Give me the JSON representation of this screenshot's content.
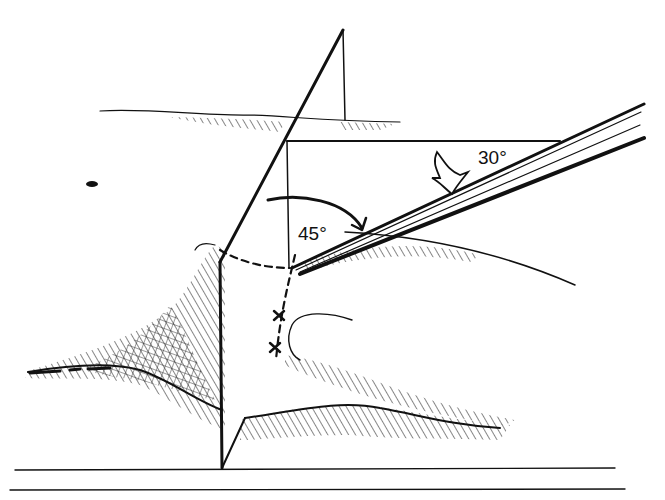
{
  "diagram": {
    "type": "medical-illustration",
    "labels": {
      "angle_horizontal": "30°",
      "angle_vertical": "45°"
    },
    "colors": {
      "ink": "#111111",
      "background": "#ffffff"
    },
    "elements": [
      "vertical-sagittal-plane",
      "horizontal-reference-plane",
      "needle",
      "curved-arrow-45",
      "notched-arrow-30",
      "dashed-incision-path",
      "x-markers",
      "eye-outline",
      "hatched-skin-folds",
      "baseline-lines"
    ]
  }
}
